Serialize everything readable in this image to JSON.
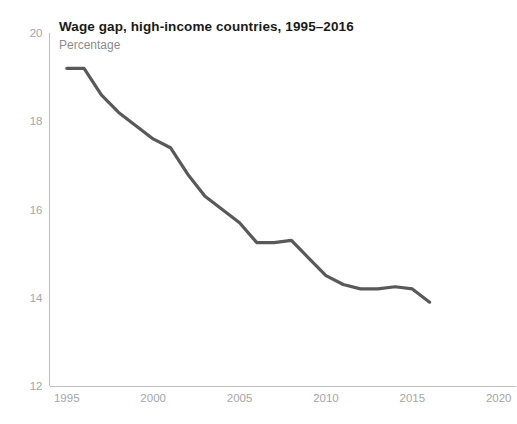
{
  "chart_data": {
    "type": "line",
    "title": "Wage gap, high-income countries, 1995–2016",
    "subtitle": "Percentage",
    "xlabel": "",
    "ylabel": "",
    "ylim": [
      12,
      20
    ],
    "xlim": [
      1994,
      2021
    ],
    "grid": false,
    "legend": "none",
    "line_color": "#595959",
    "axis_color": "#bfbfbf",
    "tick_label_color": "#a6a6a6",
    "title_color": "#1a1a1a",
    "subtitle_color": "#8c8c8c",
    "yticks": [
      12,
      14,
      16,
      18,
      20
    ],
    "ytick_labels": [
      "12",
      "14",
      "16",
      "18",
      "20"
    ],
    "xticks": [
      1995,
      2000,
      2005,
      2010,
      2015,
      2020
    ],
    "xtick_labels": [
      "1995",
      "2000",
      "2005",
      "2010",
      "2015",
      "2020"
    ],
    "x": [
      1995,
      1996,
      1997,
      1998,
      1999,
      2000,
      2001,
      2002,
      2003,
      2004,
      2005,
      2006,
      2007,
      2008,
      2009,
      2010,
      2011,
      2012,
      2013,
      2014,
      2015,
      2016
    ],
    "values": [
      19.2,
      19.2,
      18.6,
      18.2,
      17.9,
      17.6,
      17.4,
      16.8,
      16.3,
      16.0,
      15.7,
      15.25,
      15.25,
      15.3,
      14.9,
      14.5,
      14.3,
      14.2,
      14.2,
      14.25,
      14.2,
      13.9
    ],
    "series": [
      {
        "name": "Wage gap",
        "values": [
          19.2,
          19.2,
          18.6,
          18.2,
          17.9,
          17.6,
          17.4,
          16.8,
          16.3,
          16.0,
          15.7,
          15.25,
          15.25,
          15.3,
          14.9,
          14.5,
          14.3,
          14.2,
          14.2,
          14.25,
          14.2,
          13.9
        ]
      }
    ]
  }
}
